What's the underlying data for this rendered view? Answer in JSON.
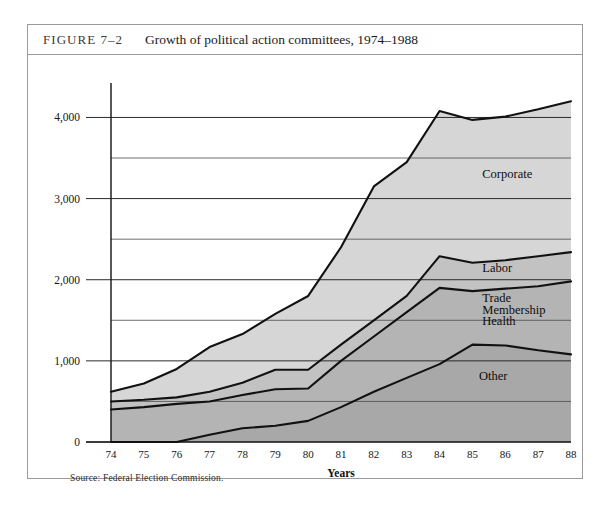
{
  "figure": {
    "number": "FIGURE 7–2",
    "caption": "Growth of political action committees, 1974–1988",
    "source": "Source: Federal Election Commission."
  },
  "chart_data": {
    "type": "area",
    "stacked": true,
    "title": "Growth of political action committees, 1974–1988",
    "xlabel": "Years",
    "ylabel": "",
    "categories": [
      "74",
      "75",
      "76",
      "77",
      "78",
      "79",
      "80",
      "81",
      "82",
      "83",
      "84",
      "85",
      "86",
      "87",
      "88"
    ],
    "x": [
      1974,
      1975,
      1976,
      1977,
      1978,
      1979,
      1980,
      1981,
      1982,
      1983,
      1984,
      1985,
      1986,
      1987,
      1988
    ],
    "ylim": [
      0,
      4400
    ],
    "yticks": [
      0,
      1000,
      2000,
      3000,
      4000
    ],
    "ytick_labels": [
      "0",
      "1,000",
      "2,000",
      "3,000",
      "4,000"
    ],
    "minor_gridlines": [
      500,
      1500,
      2500,
      3500
    ],
    "grid": true,
    "legend": "in-plot band labels",
    "series": [
      {
        "name": "Other",
        "order": 1,
        "color": "#a8a8a8",
        "values": [
          0,
          0,
          0,
          90,
          170,
          200,
          260,
          430,
          620,
          790,
          960,
          1200,
          1190,
          1130,
          1080
        ]
      },
      {
        "name": "Trade Membership Health",
        "order": 2,
        "color": "#b4b4b4",
        "values": [
          400,
          430,
          470,
          500,
          580,
          650,
          660,
          1000,
          1300,
          1600,
          1900,
          1860,
          1890,
          1920,
          1980
        ]
      },
      {
        "name": "Labor",
        "order": 3,
        "color": "#c2c2c2",
        "values": [
          500,
          520,
          550,
          620,
          730,
          890,
          890,
          1200,
          1500,
          1800,
          2290,
          2210,
          2240,
          2290,
          2340
        ]
      },
      {
        "name": "Corporate",
        "order": 4,
        "color": "#d6d6d6",
        "values": [
          620,
          720,
          900,
          1170,
          1330,
          1580,
          1800,
          2400,
          3150,
          3450,
          4080,
          3970,
          4010,
          4100,
          4200
        ]
      }
    ],
    "band_labels": [
      {
        "text": "Corporate",
        "x_year": 1985.3,
        "y_value": 3250
      },
      {
        "text": "Labor",
        "x_year": 1985.3,
        "y_value": 2090
      },
      {
        "text": "Trade",
        "x_year": 1985.3,
        "y_value": 1720
      },
      {
        "text": "Membership",
        "x_year": 1985.3,
        "y_value": 1580
      },
      {
        "text": "Health",
        "x_year": 1985.3,
        "y_value": 1440
      },
      {
        "text": "Other",
        "x_year": 1985.2,
        "y_value": 760
      }
    ]
  }
}
